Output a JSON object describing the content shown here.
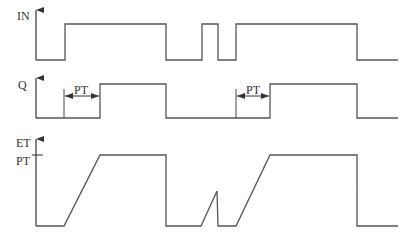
{
  "diagram": {
    "type": "timing-diagram",
    "line_color": "#555555",
    "signals": [
      {
        "name": "IN",
        "label": "IN",
        "points": [
          [
            36,
            60
          ],
          [
            65,
            60
          ],
          [
            65,
            24
          ],
          [
            166,
            24
          ],
          [
            166,
            60
          ],
          [
            202,
            60
          ],
          [
            202,
            24
          ],
          [
            218,
            24
          ],
          [
            218,
            60
          ],
          [
            236,
            60
          ],
          [
            236,
            24
          ],
          [
            357,
            24
          ],
          [
            357,
            60
          ],
          [
            398,
            60
          ]
        ]
      },
      {
        "name": "Q",
        "label": "Q",
        "points": [
          [
            36,
            118
          ],
          [
            100,
            118
          ],
          [
            100,
            84
          ],
          [
            166,
            84
          ],
          [
            166,
            118
          ],
          [
            270,
            118
          ],
          [
            270,
            84
          ],
          [
            357,
            84
          ],
          [
            357,
            118
          ],
          [
            398,
            118
          ]
        ],
        "markers": [
          [
            64,
            89,
            64,
            118
          ],
          [
            236,
            89,
            236,
            118
          ]
        ],
        "pt_arrows": [
          {
            "x1": 64,
            "x2": 100,
            "y": 96,
            "label": "PT"
          },
          {
            "x1": 236,
            "x2": 270,
            "y": 96,
            "label": "PT"
          }
        ]
      },
      {
        "name": "ET",
        "label": "ET",
        "pt_tick_label": "PT",
        "points": [
          [
            36,
            226
          ],
          [
            64,
            226
          ],
          [
            100,
            155
          ],
          [
            166,
            155
          ],
          [
            166,
            226
          ],
          [
            201,
            226
          ],
          [
            217,
            191
          ],
          [
            218,
            226
          ],
          [
            236,
            226
          ],
          [
            270,
            155
          ],
          [
            357,
            155
          ],
          [
            357,
            226
          ],
          [
            398,
            226
          ]
        ]
      }
    ]
  }
}
